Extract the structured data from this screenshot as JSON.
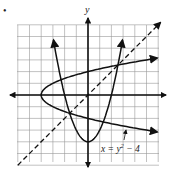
{
  "figure": {
    "axis_labels": {
      "y": "y"
    },
    "curve_label": {
      "x": "x",
      "eq": " = y",
      "sup": "2",
      "rest": " − 4"
    },
    "bullet": "•"
  },
  "chart_data": {
    "type": "line",
    "title": "",
    "xlabel": "",
    "ylabel": "y",
    "xlim": [
      -6,
      6
    ],
    "ylim": [
      -6,
      6
    ],
    "grid": true,
    "series": [
      {
        "name": "x = y^2 - 4",
        "style": "solid",
        "description": "sideways parabola, vertex (-4,0)"
      },
      {
        "name": "y = x^2 - 4",
        "style": "solid",
        "description": "upward parabola, vertex (0,-4)"
      },
      {
        "name": "y = x",
        "style": "dashed",
        "description": "line of reflection"
      }
    ],
    "annotations": [
      "x = y^2 - 4"
    ]
  }
}
